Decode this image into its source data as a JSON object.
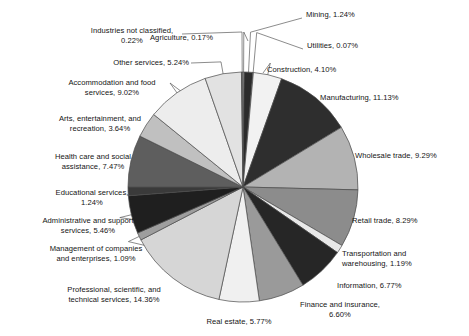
{
  "chart_data": {
    "type": "pie",
    "title": "",
    "units": "percent",
    "legend_position": "none",
    "labels_outside": true,
    "start_angle_deg": -90,
    "direction": "clockwise",
    "categories": [
      "Agriculture",
      "Mining",
      "Utilities",
      "Construction",
      "Manufacturing",
      "Wholesale trade",
      "Retail trade",
      "Transportation and warehousing",
      "Information",
      "Finance and insurance",
      "Real estate",
      "Professional, scientific, and technical services",
      "Management of companies and enterprises",
      "Administrative and support services",
      "Educational services",
      "Health care and social assistance",
      "Arts, entertainment, and recreation",
      "Accommodation and food services",
      "Other services",
      "Industries not classified"
    ],
    "values": [
      0.17,
      1.24,
      0.07,
      4.1,
      11.13,
      9.29,
      8.29,
      1.19,
      6.77,
      6.6,
      5.77,
      14.36,
      1.09,
      5.46,
      1.24,
      7.47,
      3.64,
      9.02,
      5.24,
      0.22
    ],
    "colors": [
      "#f4f4f4",
      "#2b2b2b",
      "#d9d9d9",
      "#f2f2f2",
      "#2e2e2e",
      "#b3b3b3",
      "#8c8c8c",
      "#e8e8e8",
      "#262626",
      "#9a9a9a",
      "#f0f0f0",
      "#d6d6d6",
      "#9e9e9e",
      "#1f1f1f",
      "#3a3a3a",
      "#5e5e5e",
      "#c0c0c0",
      "#ededed",
      "#e2e2e2",
      "#757575"
    ],
    "slice_labels": [
      "Agriculture, 0.17%",
      "Mining, 1.24%",
      "Utilities, 0.07%",
      "Construction, 4.10%",
      "Manufacturing, 11.13%",
      "Wholesale trade, 9.29%",
      "Retail trade, 8.29%",
      "Transportation and\nwarehousing, 1.19%",
      "Information, 6.77%",
      "Finance and insurance,\n6.60%",
      "Real estate, 5.77%",
      "Professional, scientific, and\ntechnical services, 14.36%",
      "Management of companies\nand enterprises, 1.09%",
      "Administrative and support\nservices, 5.46%",
      "Educational services,\n1.24%",
      "Health care and social\nassistance, 7.47%",
      "Arts, entertainment, and\nrecreation, 3.64%",
      "Accommodation and food\nservices, 9.02%",
      "Other services, 5.24%",
      "Industries not classified,\n0.22%"
    ]
  },
  "geometry": {
    "center_x": 243,
    "center_y": 187,
    "radius": 115
  },
  "style": {
    "slice_outline_color": "#4a4a4a",
    "leader_line_color": "#5a5a5a",
    "background": "#ffffff"
  },
  "label_positions": [
    {
      "name": "agriculture",
      "x": 150,
      "y": 33,
      "w": 100,
      "align": "ta-left"
    },
    {
      "name": "mining",
      "x": 306,
      "y": 10,
      "w": 90,
      "align": "ta-left"
    },
    {
      "name": "utilities",
      "x": 307,
      "y": 41,
      "w": 90,
      "align": "ta-left"
    },
    {
      "name": "construction",
      "x": 267,
      "y": 65,
      "w": 92,
      "align": "ta-left"
    },
    {
      "name": "manufacturing",
      "x": 320,
      "y": 93,
      "w": 110,
      "align": "ta-left"
    },
    {
      "name": "wholesale-trade",
      "x": 355,
      "y": 151,
      "w": 110,
      "align": "ta-left"
    },
    {
      "name": "retail-trade",
      "x": 352,
      "y": 216,
      "w": 100,
      "align": "ta-left"
    },
    {
      "name": "transportation",
      "x": 342,
      "y": 249,
      "w": 104,
      "align": "ta-left"
    },
    {
      "name": "information",
      "x": 337,
      "y": 281,
      "w": 100,
      "align": "ta-left"
    },
    {
      "name": "finance",
      "x": 287,
      "y": 300,
      "w": 106,
      "align": "ta-center"
    },
    {
      "name": "real-estate",
      "x": 187,
      "y": 317,
      "w": 104,
      "align": "ta-center"
    },
    {
      "name": "professional",
      "x": 46,
      "y": 285,
      "w": 136,
      "align": "ta-center"
    },
    {
      "name": "management",
      "x": 21,
      "y": 244,
      "w": 150,
      "align": "ta-center"
    },
    {
      "name": "administrative",
      "x": 12,
      "y": 216,
      "w": 152,
      "align": "ta-center"
    },
    {
      "name": "educational",
      "x": 26,
      "y": 188,
      "w": 132,
      "align": "ta-center"
    },
    {
      "name": "health-care",
      "x": 28,
      "y": 152,
      "w": 130,
      "align": "ta-center"
    },
    {
      "name": "arts",
      "x": 36,
      "y": 114,
      "w": 128,
      "align": "ta-center"
    },
    {
      "name": "accommodation",
      "x": 46,
      "y": 78,
      "w": 132,
      "align": "ta-center"
    },
    {
      "name": "other-services",
      "x": 93,
      "y": 58,
      "w": 96,
      "align": "ta-right"
    },
    {
      "name": "industries-nc",
      "x": 76,
      "y": 26,
      "w": 112,
      "align": "ta-center"
    }
  ]
}
